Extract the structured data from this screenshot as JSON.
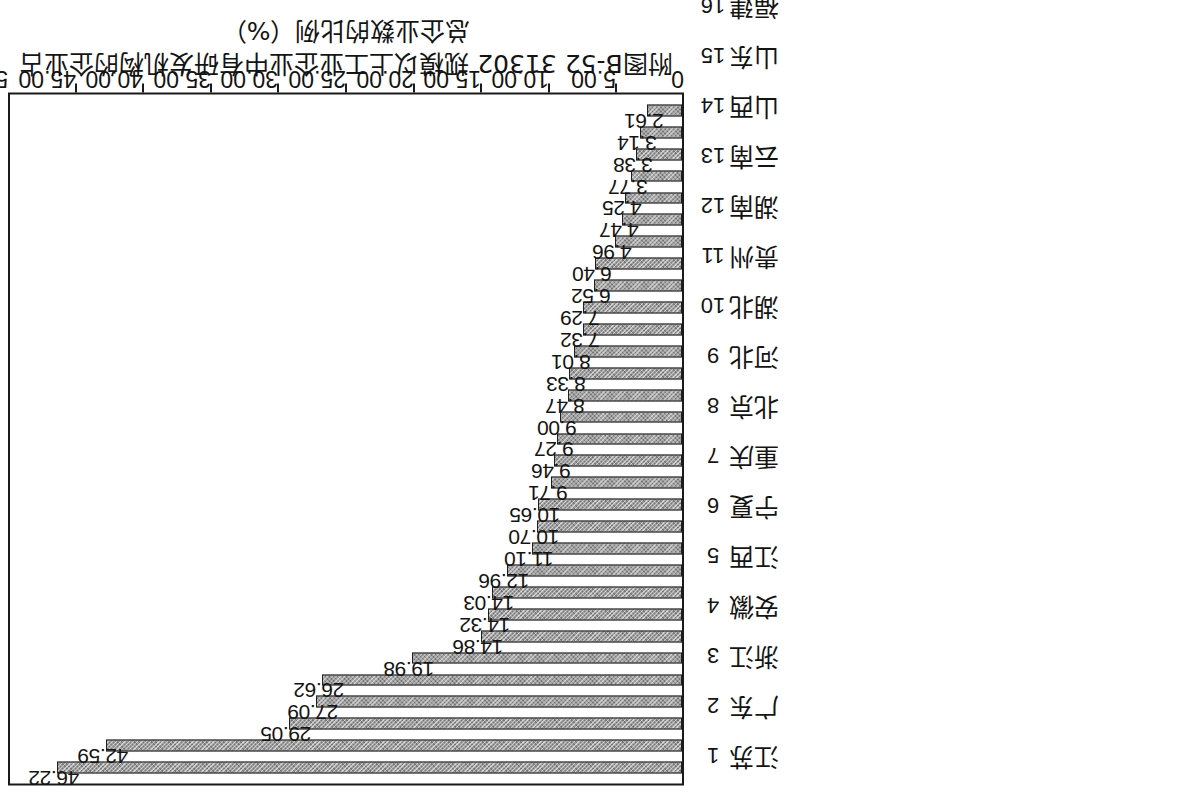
{
  "caption": {
    "line1": "附图B-52  31302 规模以上工业企业中有研发机构的企业占",
    "line2": "总企业数的比例（%）"
  },
  "chart_data": {
    "type": "bar",
    "xlabel": "",
    "ylabel": "",
    "orientation": "vertical-bars-rotated-90",
    "grid": false,
    "legend": null,
    "ylim": [
      0,
      50
    ],
    "ytick_labels": [
      "0",
      "5.00",
      "10.00",
      "15.00",
      "20.00",
      "25.00",
      "30.00",
      "35.00",
      "40.00",
      "45.00",
      "50.00"
    ],
    "yticks": [
      0,
      5,
      10,
      15,
      20,
      25,
      30,
      35,
      40,
      45,
      50
    ],
    "ranks": [
      "1",
      "2",
      "3",
      "4",
      "5",
      "6",
      "7",
      "8",
      "9",
      "10",
      "11",
      "12",
      "13",
      "14",
      "15",
      "16",
      "17",
      "18",
      "19",
      "20",
      "21",
      "22",
      "23",
      "24",
      "25",
      "26",
      "27",
      "28",
      "29",
      "30",
      "31"
    ],
    "categories": [
      "江苏",
      "广东",
      "浙江",
      "安徽",
      "江西",
      "宁夏",
      "重庆",
      "北京",
      "河北",
      "湖北",
      "贵州",
      "湖南",
      "云南",
      "山西",
      "山东",
      "福建",
      "天津",
      "四川",
      "河南",
      "海南",
      "上海",
      "甘肃",
      "陕西",
      "辽宁",
      "青海",
      "吉林",
      "广西",
      "黑龙江",
      "西藏",
      "内蒙古",
      "新疆"
    ],
    "values": [
      46.22,
      42.59,
      29.05,
      27.09,
      26.62,
      19.98,
      14.86,
      14.32,
      14.03,
      12.96,
      11.1,
      10.7,
      10.65,
      9.71,
      9.46,
      9.27,
      9.0,
      8.47,
      8.33,
      8.01,
      7.32,
      7.29,
      6.52,
      6.4,
      4.96,
      4.47,
      4.25,
      3.77,
      3.38,
      3.14,
      2.61
    ],
    "value_labels": [
      "46.22",
      "42.59",
      "29.05",
      "27.09",
      "26.62",
      "19.98",
      "14.86",
      "14.32",
      "14.03",
      "12.96",
      "11.10",
      "10.70",
      "10.65",
      "9.71",
      "9.46",
      "9.27",
      "9.00",
      "8.47",
      "8.33",
      "8.01",
      "7.32",
      "7.29",
      "6.52",
      "6.40",
      "4.96",
      "4.47",
      "4.25",
      "3.77",
      "3.38",
      "3.14",
      "2.61"
    ],
    "colors": {
      "bar_fill": "#9d9d9d",
      "bar_edge": "#1f1f1f",
      "frame": "#1a1a1a",
      "text": "#141414",
      "background": "#ffffff"
    }
  }
}
